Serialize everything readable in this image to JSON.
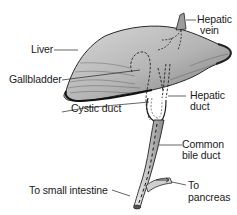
{
  "diagram": {
    "type": "anatomical-illustration",
    "labels": {
      "liver": "Liver",
      "gallbladder": "Gallbladder",
      "cystic_duct": "Cystic duct",
      "to_small_intestine": "To small intestine",
      "hepatic_vein_line1": "Hepatic",
      "hepatic_vein_line2": "vein",
      "hepatic_duct_line1": "Hepatic",
      "hepatic_duct_line2": "duct",
      "common_bile_duct_line1": "Common",
      "common_bile_duct_line2": "bile duct",
      "to_pancreas_line1": "To",
      "to_pancreas_line2": "pancreas"
    },
    "colors": {
      "ink": "#1a1a1a",
      "liver_fill": "#bdbdbd",
      "liver_dark": "#6e6e6e",
      "background": "#ffffff"
    }
  }
}
